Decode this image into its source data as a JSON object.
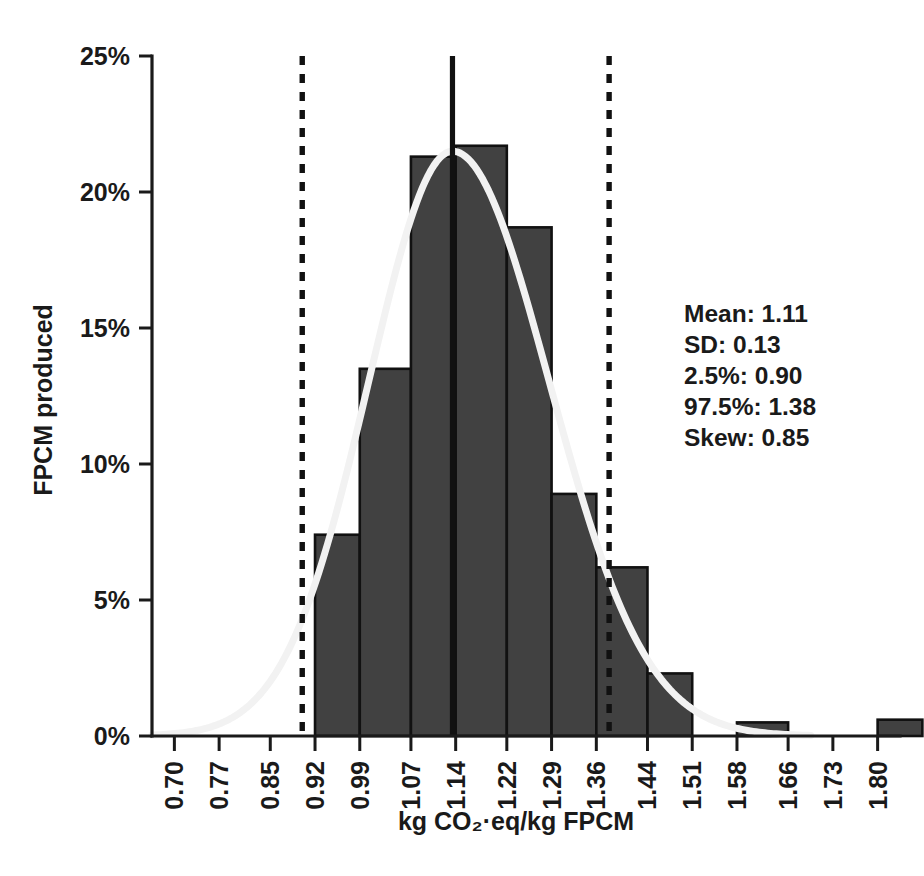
{
  "chart_data": {
    "type": "bar",
    "title": "",
    "subtitle": "",
    "xlabel": "kg CO₂·eq/kg FPCM",
    "ylabel": "FPCM produced",
    "grid": false,
    "legend": "none",
    "xlim": [
      0.665,
      1.835
    ],
    "ylim": [
      0,
      25
    ],
    "bin_width": 0.07333,
    "categories": [
      "0.70",
      "0.77",
      "0.85",
      "0.92",
      "0.99",
      "1.07",
      "1.14",
      "1.22",
      "1.29",
      "1.36",
      "1.44",
      "1.51",
      "1.58",
      "1.66",
      "1.73",
      "1.80"
    ],
    "xtick_labels": [
      "0.70",
      "0.77",
      "0.85",
      "0.92",
      "0.99",
      "1.07",
      "1.14",
      "1.22",
      "1.29",
      "1.36",
      "1.44",
      "1.51",
      "1.58",
      "1.66",
      "1.73",
      "1.80"
    ],
    "xtick_values": [
      0.7,
      0.77,
      0.85,
      0.92,
      0.99,
      1.07,
      1.14,
      1.22,
      1.29,
      1.36,
      1.44,
      1.51,
      1.58,
      1.66,
      1.73,
      1.8
    ],
    "ytick_labels": [
      "0%",
      "5%",
      "10%",
      "15%",
      "20%",
      "25%"
    ],
    "ytick_values": [
      0,
      5,
      10,
      15,
      20,
      25
    ],
    "bars": [
      {
        "bin_start": 0.92,
        "bin_end": 0.99,
        "value": 7.4
      },
      {
        "bin_start": 0.99,
        "bin_end": 1.07,
        "value": 13.5
      },
      {
        "bin_start": 1.07,
        "bin_end": 1.14,
        "value": 21.3
      },
      {
        "bin_start": 1.14,
        "bin_end": 1.22,
        "value": 21.7
      },
      {
        "bin_start": 1.22,
        "bin_end": 1.29,
        "value": 18.7
      },
      {
        "bin_start": 1.29,
        "bin_end": 1.36,
        "value": 8.9
      },
      {
        "bin_start": 1.36,
        "bin_end": 1.44,
        "value": 6.2
      },
      {
        "bin_start": 1.44,
        "bin_end": 1.51,
        "value": 2.3
      },
      {
        "bin_start": 1.58,
        "bin_end": 1.66,
        "value": 0.5
      },
      {
        "bin_start": 1.8,
        "bin_end": 1.87,
        "value": 0.6
      }
    ],
    "values": [
      0,
      0,
      0,
      7.4,
      13.5,
      21.3,
      21.7,
      18.7,
      8.9,
      6.2,
      2.3,
      0,
      0.5,
      0,
      0,
      0.6
    ],
    "density_curve": {
      "label": "fitted distribution",
      "color": "#f2f2f2",
      "peak_value": 21.5,
      "peak_x": 1.135
    },
    "reference_lines": [
      {
        "name": "p2.5",
        "x": 0.9,
        "style": "dashed",
        "color": "#111111"
      },
      {
        "name": "p97.5",
        "x": 1.38,
        "style": "dashed",
        "color": "#111111"
      },
      {
        "name": "mean",
        "x": 1.135,
        "style": "solid",
        "color": "#111111"
      }
    ],
    "annotations": {
      "stats": [
        "Mean: 1.11",
        "SD: 0.13",
        "2.5%: 0.90",
        "97.5%: 1.38",
        "Skew: 0.85"
      ],
      "stat_values": {
        "mean": "1.11",
        "sd": "0.13",
        "p2_5": "0.90",
        "p97_5": "1.38",
        "skew": "0.85"
      }
    },
    "colors": {
      "bar_fill": "#414141",
      "bar_stroke": "#111111",
      "curve": "#f2f2f2",
      "axis": "#1a1a1a",
      "background": "#ffffff"
    }
  }
}
